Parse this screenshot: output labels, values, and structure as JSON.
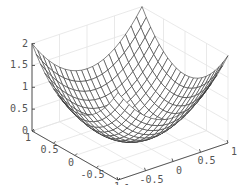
{
  "chart_data": {
    "type": "surface3d",
    "title": "",
    "function": "z = x^2 + y^2",
    "x": {
      "label": "",
      "range": [
        -1,
        1
      ],
      "ticks": [
        -1,
        -0.5,
        0,
        0.5,
        1
      ],
      "tick_labels": [
        "-1",
        "-0.5",
        "0",
        "0.5",
        "1"
      ]
    },
    "y": {
      "label": "",
      "range": [
        -1,
        1
      ],
      "ticks": [
        -1,
        -0.5,
        0,
        0.5,
        1
      ],
      "tick_labels": [
        "-1",
        "-0.5",
        "0",
        "0.5",
        "1"
      ]
    },
    "z": {
      "label": "",
      "range": [
        0,
        2
      ],
      "ticks": [
        0,
        0.5,
        1,
        1.5,
        2
      ],
      "tick_labels": [
        "0",
        "0.5",
        "1",
        "1.5",
        "2"
      ]
    },
    "mesh_steps": 20,
    "grid": true,
    "colors": {
      "mesh_edge": "#333333",
      "mesh_face": "#ffffff",
      "grid": "#e3e3e3",
      "axis": "#444444",
      "text": "#555555"
    },
    "sample_points": [
      {
        "x": -1,
        "y": -1,
        "z": 2
      },
      {
        "x": -1,
        "y": 1,
        "z": 2
      },
      {
        "x": 1,
        "y": -1,
        "z": 2
      },
      {
        "x": 1,
        "y": 1,
        "z": 2
      },
      {
        "x": 0,
        "y": 0,
        "z": 0
      },
      {
        "x": 0.5,
        "y": 0.5,
        "z": 0.5
      },
      {
        "x": 1,
        "y": 0,
        "z": 1
      },
      {
        "x": 0,
        "y": 1,
        "z": 1
      }
    ]
  }
}
